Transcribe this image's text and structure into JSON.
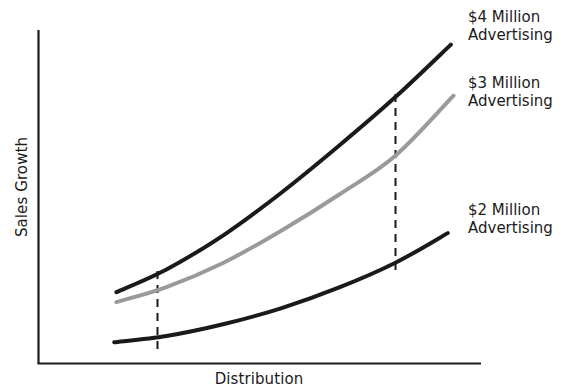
{
  "chart_data": {
    "type": "line",
    "title": "",
    "xlabel": "Distribution",
    "ylabel": "Sales Growth",
    "grid": false,
    "legend_position": "right-inline-annotations",
    "axis_ranges": {
      "x": [
        0,
        1
      ],
      "y": [
        0,
        1
      ]
    },
    "axis_ticks": {
      "x": [],
      "y": []
    },
    "series": [
      {
        "name": "$4 Million Advertising",
        "label_line1": "$4 Million",
        "label_line2": "Advertising",
        "color": "#1a1a1a",
        "stroke_width": 4,
        "points": [
          {
            "x": 0.177,
            "y": 0.213
          },
          {
            "x": 0.29,
            "y": 0.281
          },
          {
            "x": 0.42,
            "y": 0.385
          },
          {
            "x": 0.55,
            "y": 0.512
          },
          {
            "x": 0.68,
            "y": 0.653
          },
          {
            "x": 0.808,
            "y": 0.8
          },
          {
            "x": 0.932,
            "y": 0.956
          }
        ]
      },
      {
        "name": "$3 Million Advertising",
        "label_line1": "$3 Million",
        "label_line2": "Advertising",
        "color": "#9a9a9a",
        "stroke_width": 4,
        "points": [
          {
            "x": 0.177,
            "y": 0.183
          },
          {
            "x": 0.29,
            "y": 0.228
          },
          {
            "x": 0.42,
            "y": 0.302
          },
          {
            "x": 0.55,
            "y": 0.398
          },
          {
            "x": 0.68,
            "y": 0.506
          },
          {
            "x": 0.808,
            "y": 0.624
          },
          {
            "x": 0.938,
            "y": 0.803
          }
        ]
      },
      {
        "name": "$2 Million Advertising",
        "label_line1": "$2 Million",
        "label_line2": "Advertising",
        "color": "#1a1a1a",
        "stroke_width": 4,
        "points": [
          {
            "x": 0.172,
            "y": 0.062
          },
          {
            "x": 0.29,
            "y": 0.081
          },
          {
            "x": 0.42,
            "y": 0.117
          },
          {
            "x": 0.55,
            "y": 0.165
          },
          {
            "x": 0.68,
            "y": 0.227
          },
          {
            "x": 0.808,
            "y": 0.302
          },
          {
            "x": 0.925,
            "y": 0.39
          }
        ]
      }
    ],
    "reference_lines": [
      {
        "name": "lower-distribution-level",
        "x": 0.268,
        "style": "dashed",
        "color": "#1a1a1a"
      },
      {
        "name": "higher-distribution-level",
        "x": 0.807,
        "style": "dashed",
        "color": "#1a1a1a"
      }
    ],
    "annotations": [
      {
        "text": "$4 Million Advertising",
        "anchor": "top-right"
      },
      {
        "text": "$3 Million Advertising",
        "anchor": "middle-right"
      },
      {
        "text": "$2 Million Advertising",
        "anchor": "bottom-right"
      }
    ]
  }
}
